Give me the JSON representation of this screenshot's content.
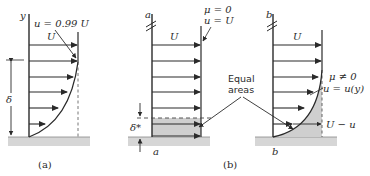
{
  "panel_a": {
    "y_axis_label": "y",
    "edge_label": "u = 0.99 U",
    "freestream_label": "U",
    "thickness_label": "δ",
    "caption": "(a)"
  },
  "panel_b": {
    "caption": "(b)",
    "inviscid": {
      "section_top_label": "a",
      "section_bottom_label": "a",
      "freestream_label": "U",
      "viscosity_label": "μ = 0",
      "velocity_label": "u = U",
      "displacement_label": "δ*"
    },
    "viscous": {
      "section_top_label": "b",
      "section_bottom_label": "b",
      "freestream_label": "U",
      "viscosity_label": "μ ≠ 0",
      "velocity_label": "u = u(y)",
      "deficit_label": "U − u"
    },
    "equal_areas_label_line1": "Equal",
    "equal_areas_label_line2": "areas"
  },
  "colors": {
    "line": "#2a2a2a",
    "shade": "#cfcfcf",
    "wall": "#d6d6d6"
  }
}
